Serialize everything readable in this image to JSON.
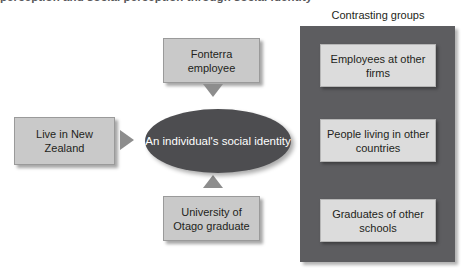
{
  "page": {
    "running_title": "perception and social perception through social identity"
  },
  "panel": {
    "caption": "Contrasting groups",
    "color": "#5d5d60",
    "boxes": [
      {
        "label": "Employees at other firms"
      },
      {
        "label": "People living in other countries"
      },
      {
        "label": "Graduates of other schools"
      }
    ]
  },
  "center": {
    "label": "An individual's social identity",
    "color": "#4d4d50",
    "text_color": "#ffffff"
  },
  "attributes": [
    {
      "label": "Fonterra employee",
      "arrow": "arrow-down-icon"
    },
    {
      "label": "Live in New Zealand",
      "arrow": "arrow-right-icon"
    },
    {
      "label": "University of Otago graduate",
      "arrow": "arrow-up-icon"
    }
  ],
  "colors": {
    "box_fill": "#c9c9c9",
    "panel_box_fill": "#dcdcdc",
    "arrow": "#8d8d8d",
    "text": "#231f20"
  }
}
